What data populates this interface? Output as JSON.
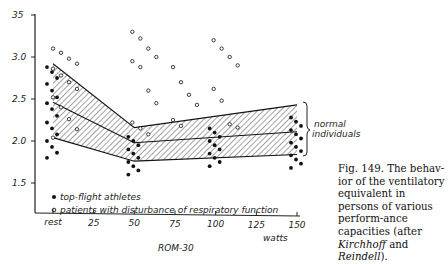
{
  "chart_data": {
    "type": "scatter",
    "title": "",
    "xlabel": "watts",
    "x_sublabel": "ROM-30",
    "ylabel": "",
    "ylim": [
      15,
      35
    ],
    "yticks": [
      15,
      20,
      25,
      30,
      35
    ],
    "ytick_labels": [
      "1.5",
      "2.0",
      "2.5",
      "3.0",
      "35"
    ],
    "xticks": [
      0,
      25,
      50,
      75,
      100,
      125,
      150
    ],
    "xtick_labels": [
      "rest",
      "25",
      "50",
      "75",
      "100",
      "125",
      "150"
    ],
    "grid": false,
    "legend": [
      {
        "marker": "filled-circle",
        "label": "top-flight athletes"
      },
      {
        "marker": "open-circle",
        "label": "patients with disturbance of respiratory function"
      }
    ],
    "band": {
      "label": "normal individuals",
      "x": [
        0,
        50,
        150
      ],
      "upper": [
        29.2,
        21.6,
        24.3
      ],
      "mean": [
        24.6,
        19.8,
        21.1
      ],
      "lower": [
        20.4,
        17.6,
        18.4
      ]
    },
    "series": [
      {
        "name": "top-flight athletes",
        "approx_points": {
          "rest": [
            28.8,
            28.2,
            27.5,
            26.8,
            26.0,
            25.2,
            24.5,
            23.8,
            23.0,
            22.2,
            21.5,
            20.8,
            20.0,
            19.3,
            18.6,
            18.0
          ],
          "50": [
            20.5,
            20.0,
            19.5,
            19.0,
            18.5,
            18.0,
            17.5,
            17.0,
            16.5,
            16.0
          ],
          "100": [
            21.5,
            21.0,
            20.5,
            20.0,
            19.5,
            19.0,
            18.5,
            18.0,
            17.5,
            17.0
          ],
          "150": [
            22.8,
            22.3,
            21.8,
            21.3,
            20.8,
            20.3,
            19.8,
            19.3,
            18.8,
            18.3,
            17.8,
            17.3,
            16.8
          ]
        }
      },
      {
        "name": "patients with disturbance of respiratory function",
        "approx_points": {
          "rest": [
            31.0,
            30.5,
            29.8,
            29.2,
            28.6,
            27.8,
            27.0,
            26.2,
            25.2,
            24.0,
            22.6,
            21.4,
            20.4
          ],
          "50": [
            33.0,
            32.2,
            31.0,
            30.0,
            29.5,
            28.8,
            26.0,
            24.5,
            22.2,
            21.5,
            20.8
          ],
          "75": [
            28.8,
            27.0,
            25.5,
            24.3,
            22.5,
            21.8
          ],
          "100": [
            32.0,
            31.0,
            30.0,
            29.0,
            26.2,
            24.8,
            22.0,
            21.6
          ],
          "150": []
        }
      }
    ]
  },
  "labels": {
    "band_label_line1": "normal",
    "band_label_line2": "individuals",
    "legend_athletes": "top-flight  athletes",
    "legend_patients": "patients with disturbance of respiratory function",
    "x_unit": "watts",
    "x_sublabel": "ROM-30"
  },
  "caption": {
    "prefix": "Fig. 149. The behav-ior of the ventilatory equivalent in persons of various perform-ance capacities (after ",
    "author1": "Kirchhoff",
    "conj": " and ",
    "author2": "Reindell",
    "suffix": ")."
  }
}
